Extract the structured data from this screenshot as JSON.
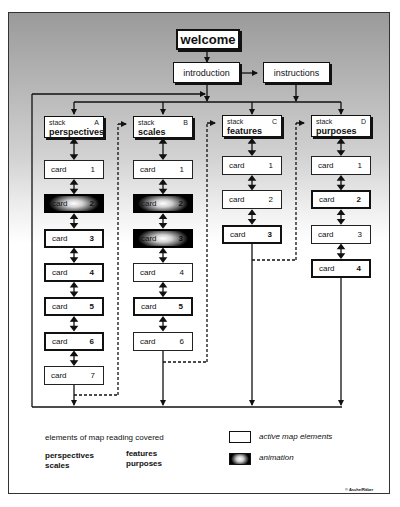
{
  "header": {
    "welcome": "welcome",
    "introduction": "introduction",
    "instructions": "instructions"
  },
  "stacks": [
    {
      "prefix": "stack",
      "letter": "A",
      "name": "perspectives",
      "cards": [
        {
          "label": "card",
          "num": "1",
          "style": "normal"
        },
        {
          "label": "card",
          "num": "2",
          "style": "animation"
        },
        {
          "label": "card",
          "num": "3",
          "style": "active"
        },
        {
          "label": "card",
          "num": "4",
          "style": "active"
        },
        {
          "label": "card",
          "num": "5",
          "style": "active"
        },
        {
          "label": "card",
          "num": "6",
          "style": "active"
        },
        {
          "label": "card",
          "num": "7",
          "style": "normal"
        }
      ]
    },
    {
      "prefix": "stack",
      "letter": "B",
      "name": "scales",
      "cards": [
        {
          "label": "card",
          "num": "1",
          "style": "normal"
        },
        {
          "label": "card",
          "num": "2",
          "style": "animation"
        },
        {
          "label": "card",
          "num": "3",
          "style": "animation"
        },
        {
          "label": "card",
          "num": "4",
          "style": "normal"
        },
        {
          "label": "card",
          "num": "5",
          "style": "active"
        },
        {
          "label": "card",
          "num": "6",
          "style": "normal"
        }
      ]
    },
    {
      "prefix": "stack",
      "letter": "C",
      "name": "features",
      "cards": [
        {
          "label": "card",
          "num": "1",
          "style": "normal"
        },
        {
          "label": "card",
          "num": "2",
          "style": "normal"
        },
        {
          "label": "card",
          "num": "3",
          "style": "active"
        }
      ]
    },
    {
      "prefix": "stack",
      "letter": "D",
      "name": "purposes",
      "cards": [
        {
          "label": "card",
          "num": "1",
          "style": "normal"
        },
        {
          "label": "card",
          "num": "2",
          "style": "active"
        },
        {
          "label": "card",
          "num": "3",
          "style": "normal"
        },
        {
          "label": "card",
          "num": "4",
          "style": "active"
        }
      ]
    }
  ],
  "legend": {
    "title": "elements of map reading covered",
    "elements": [
      "perspectives",
      "scales",
      "features",
      "purposes"
    ],
    "keys": [
      {
        "label": "active map  elements",
        "swatch": "active"
      },
      {
        "label": "animation",
        "swatch": "animation"
      }
    ]
  },
  "copyright": "© Asche/Räber"
}
